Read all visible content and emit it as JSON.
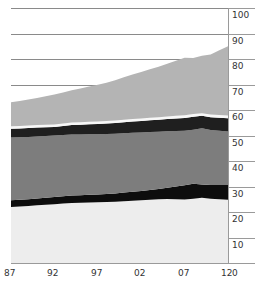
{
  "chart_data": {
    "type": "area",
    "stacked": true,
    "title": "",
    "subtitle": "",
    "xlabel": "",
    "ylabel": "",
    "xlim": [
      1987,
      2012
    ],
    "ylim": [
      0,
      100
    ],
    "grid": true,
    "grid_axis": "y",
    "gridline_values": [
      100,
      90,
      80,
      70
    ],
    "y_axis_position": "right",
    "legend": false,
    "legend_position": "none",
    "x": [
      1987,
      1988,
      1989,
      1990,
      1991,
      1992,
      1993,
      1994,
      1995,
      1996,
      1997,
      1998,
      1999,
      2000,
      2001,
      2002,
      2003,
      2004,
      2005,
      2006,
      2007,
      2008,
      2009,
      2010,
      2011,
      2012
    ],
    "x_tick_values": [
      1987,
      1992,
      1997,
      2002,
      2007,
      2012
    ],
    "x_tick_labels": [
      "87",
      "92",
      "97",
      "02",
      "07",
      "12"
    ],
    "y_tick_values": [
      0,
      10,
      20,
      30,
      40,
      50,
      60,
      70,
      80,
      90,
      100
    ],
    "y_tick_labels": [
      "0",
      "10",
      "20",
      "30",
      "40",
      "50",
      "60",
      "70",
      "80",
      "90",
      "100"
    ],
    "origin_label": "0",
    "series": [
      {
        "name": "band-1-bottom",
        "color": "#ededed",
        "values": [
          22.0,
          22.2,
          22.4,
          22.6,
          22.8,
          23.0,
          23.3,
          23.5,
          23.6,
          23.7,
          23.8,
          23.9,
          24.0,
          24.2,
          24.4,
          24.6,
          24.8,
          25.0,
          25.1,
          25.0,
          24.9,
          25.2,
          25.6,
          25.2,
          25.0,
          24.8
        ]
      },
      {
        "name": "band-2",
        "color": "#0d0d0d",
        "values": [
          2.6,
          2.6,
          2.6,
          2.7,
          2.8,
          2.9,
          2.9,
          3.0,
          3.0,
          3.1,
          3.1,
          3.2,
          3.3,
          3.4,
          3.5,
          3.6,
          3.8,
          4.0,
          4.4,
          5.0,
          5.6,
          5.9,
          5.2,
          5.4,
          5.6,
          5.8
        ]
      },
      {
        "name": "band-3",
        "color": "#7d7d7d",
        "values": [
          24.6,
          24.5,
          24.4,
          24.3,
          24.2,
          24.1,
          24.0,
          23.9,
          23.8,
          23.7,
          23.6,
          23.5,
          23.4,
          23.3,
          23.2,
          23.0,
          22.8,
          22.5,
          22.2,
          21.8,
          21.4,
          21.2,
          22.0,
          21.6,
          21.3,
          21.0
        ]
      },
      {
        "name": "band-4",
        "color": "#1f1f1f",
        "values": [
          3.4,
          3.4,
          3.5,
          3.5,
          3.4,
          3.3,
          3.5,
          3.7,
          3.8,
          3.9,
          4.0,
          4.1,
          4.2,
          4.3,
          4.4,
          4.5,
          4.6,
          4.7,
          4.8,
          4.9,
          5.0,
          5.1,
          4.9,
          5.0,
          5.1,
          5.2
        ]
      },
      {
        "name": "band-5",
        "color": "#f7f7f7",
        "values": [
          1.0,
          1.0,
          1.0,
          1.0,
          1.0,
          1.0,
          1.0,
          1.0,
          1.0,
          1.0,
          1.0,
          1.0,
          1.0,
          1.0,
          1.0,
          1.0,
          1.0,
          1.0,
          1.0,
          1.0,
          1.0,
          1.0,
          1.0,
          1.0,
          1.0,
          1.0
        ]
      },
      {
        "name": "band-6-top",
        "color": "#b4b4b4",
        "values": [
          9.4,
          9.8,
          10.2,
          10.6,
          11.2,
          11.8,
          12.2,
          12.6,
          13.2,
          13.8,
          14.4,
          15.0,
          15.8,
          16.6,
          17.4,
          18.2,
          19.0,
          19.8,
          20.6,
          21.6,
          22.6,
          22.0,
          22.6,
          23.6,
          25.4,
          27.2
        ]
      }
    ],
    "stack_top_values": [
      63.0,
      63.5,
      64.1,
      64.7,
      65.4,
      66.1,
      66.9,
      67.7,
      68.4,
      69.2,
      69.9,
      70.7,
      71.7,
      72.8,
      73.9,
      74.9,
      76.0,
      77.0,
      78.1,
      79.3,
      80.5,
      80.4,
      81.3,
      81.8,
      83.4,
      85.0
    ]
  }
}
